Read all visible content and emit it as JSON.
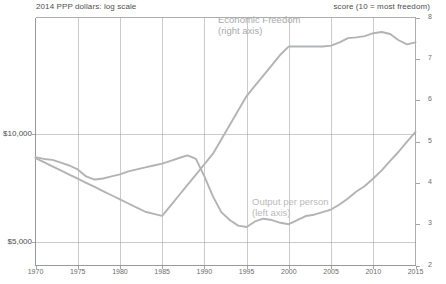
{
  "axis_notes": {
    "left": "2014 PPP dollars: log scale",
    "right": "score (10 = most freedom)"
  },
  "series_labels": {
    "freedom_line1": "Economic Freedom",
    "freedom_line2": "(right axis)",
    "output_line1": "Output per person",
    "output_line2": "(left axis)"
  },
  "colors": {
    "freedom_line": "#b2b3b5",
    "output_line": "#b2b3b5",
    "grid": "#9a9b9d",
    "frame": "#8d8e90",
    "text": "#58595b"
  },
  "chart_data": {
    "type": "line",
    "title": "",
    "xlabel": "",
    "grid": true,
    "legend": "inline-annotations",
    "x_ticks": [
      "1970",
      "1975",
      "1980",
      "1985",
      "1990",
      "1995",
      "2000",
      "2005",
      "2010",
      "2015"
    ],
    "xlim": [
      1970,
      2015
    ],
    "y_left": {
      "label": "2014 PPP dollars: log scale",
      "scale": "log",
      "ticks": [
        "$5,000",
        "$10,000"
      ],
      "tick_values": [
        5000,
        10000
      ],
      "ylim": [
        4300,
        21000
      ]
    },
    "y_right": {
      "label": "score (10 = most freedom)",
      "scale": "linear",
      "ticks": [
        "2",
        "3",
        "4",
        "5",
        "6",
        "7",
        "8"
      ],
      "tick_values": [
        2,
        3,
        4,
        5,
        6,
        7,
        8
      ],
      "ylim": [
        2,
        8
      ]
    },
    "series": [
      {
        "name": "Output per person",
        "axis": "left",
        "color": "#b2b3b5",
        "x": [
          1970,
          1971,
          1972,
          1973,
          1974,
          1975,
          1976,
          1977,
          1978,
          1979,
          1980,
          1981,
          1982,
          1983,
          1984,
          1985,
          1986,
          1987,
          1988,
          1989,
          1990,
          1991,
          1992,
          1993,
          1994,
          1995,
          1996,
          1997,
          1998,
          1999,
          2000,
          2001,
          2002,
          2003,
          2004,
          2005,
          2006,
          2007,
          2008,
          2009,
          2010,
          2011,
          2012,
          2013,
          2014,
          2015
        ],
        "y": [
          8600,
          8500,
          8450,
          8300,
          8150,
          7950,
          7600,
          7450,
          7500,
          7600,
          7700,
          7850,
          7950,
          8050,
          8150,
          8250,
          8400,
          8550,
          8700,
          8500,
          7600,
          6700,
          6050,
          5750,
          5550,
          5500,
          5700,
          5800,
          5750,
          5650,
          5600,
          5750,
          5900,
          5950,
          6050,
          6150,
          6350,
          6600,
          6900,
          7150,
          7500,
          7900,
          8400,
          8900,
          9500,
          10100
        ]
      },
      {
        "name": "Economic Freedom",
        "axis": "right",
        "color": "#b2b3b5",
        "x": [
          1970,
          1971,
          1972,
          1973,
          1974,
          1975,
          1976,
          1977,
          1978,
          1979,
          1980,
          1981,
          1982,
          1983,
          1984,
          1985,
          1986,
          1987,
          1988,
          1989,
          1990,
          1991,
          1992,
          1993,
          1994,
          1995,
          1996,
          1997,
          1998,
          1999,
          2000,
          2001,
          2002,
          2003,
          2004,
          2005,
          2006,
          2007,
          2008,
          2009,
          2010,
          2011,
          2012,
          2013,
          2014,
          2015
        ],
        "y": [
          4.6,
          4.5,
          4.4,
          4.3,
          4.2,
          4.1,
          4.0,
          3.9,
          3.8,
          3.7,
          3.6,
          3.5,
          3.4,
          3.3,
          3.25,
          3.2,
          3.45,
          3.7,
          3.95,
          4.2,
          4.45,
          4.7,
          5.05,
          5.4,
          5.75,
          6.1,
          6.35,
          6.6,
          6.85,
          7.1,
          7.3,
          7.3,
          7.3,
          7.3,
          7.3,
          7.32,
          7.4,
          7.5,
          7.52,
          7.55,
          7.62,
          7.65,
          7.6,
          7.45,
          7.35,
          7.4
        ]
      }
    ]
  }
}
